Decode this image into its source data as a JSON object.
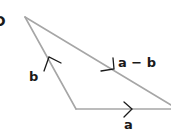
{
  "diagram": {
    "part_label": "D",
    "vectors": [
      {
        "name": "a",
        "label": "a"
      },
      {
        "name": "b",
        "label": "b"
      },
      {
        "name": "a-minus-b",
        "label": "a − b"
      }
    ],
    "line_color": "#a6a6a6",
    "text_color": "#1a1a1a"
  }
}
